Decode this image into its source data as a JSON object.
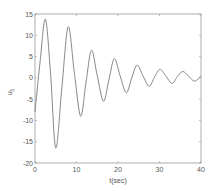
{
  "chart_data": {
    "type": "line",
    "title": "",
    "xlabel": "t(sec)",
    "ylabel": "u_1",
    "xlim": [
      0,
      40
    ],
    "ylim": [
      -20,
      15
    ],
    "xticks": [
      0,
      10,
      20,
      30,
      40
    ],
    "yticks": [
      -20,
      -15,
      -10,
      -5,
      0,
      5,
      10,
      15
    ],
    "grid": false,
    "legend": null,
    "series": [
      {
        "name": "u1",
        "color": "#888888",
        "x": [
          0,
          1.25,
          2.5,
          3.75,
          5.0,
          6.5,
          8.0,
          9.5,
          11.0,
          12.3,
          13.6,
          15.0,
          16.5,
          17.8,
          19.1,
          20.5,
          22.0,
          23.3,
          24.6,
          26.0,
          27.5,
          28.8,
          30.1,
          31.5,
          33.0,
          34.3,
          35.6,
          37.0,
          38.5,
          40.0
        ],
        "y": [
          -8.0,
          4.0,
          13.8,
          1.0,
          -16.5,
          -2.0,
          12.0,
          1.0,
          -9.0,
          -1.0,
          6.5,
          0.5,
          -5.5,
          -0.5,
          4.5,
          0.5,
          -3.5,
          0.0,
          3.0,
          0.5,
          -2.0,
          0.2,
          2.0,
          0.5,
          -1.3,
          0.3,
          1.5,
          0.4,
          -0.8,
          0.5
        ]
      }
    ]
  },
  "axes": {
    "xlabel": "t(sec)",
    "ylabel_main": "u",
    "ylabel_sub": "1",
    "xtick_labels": [
      "0",
      "10",
      "20",
      "30",
      "40"
    ],
    "ytick_labels": [
      "-20",
      "-15",
      "-10",
      "-5",
      "0",
      "5",
      "10",
      "15"
    ]
  }
}
